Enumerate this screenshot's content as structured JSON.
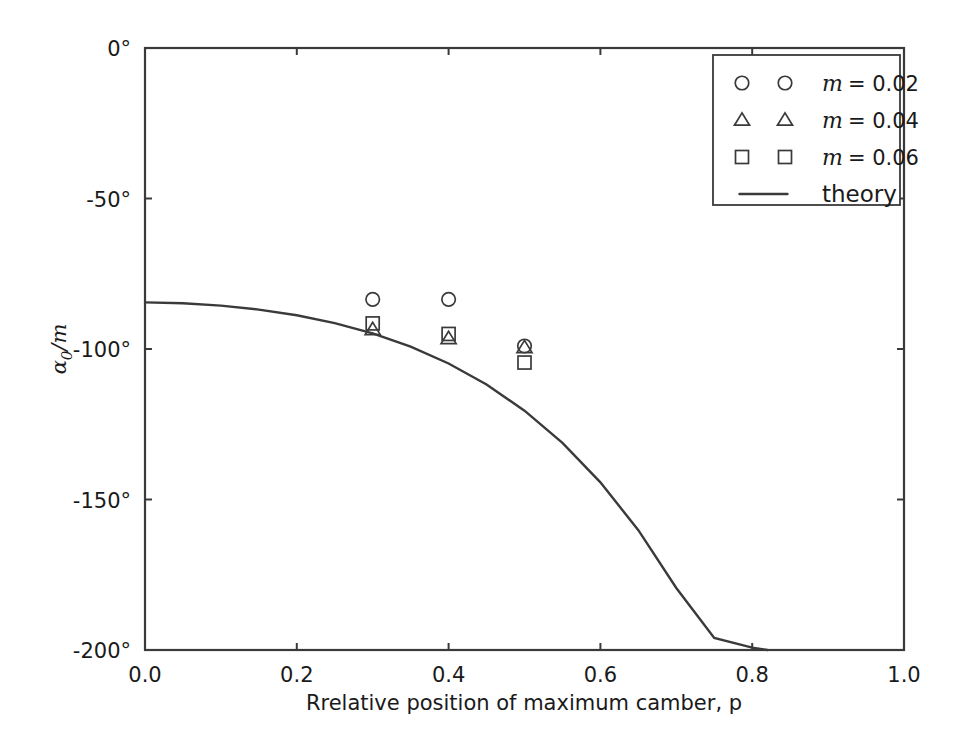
{
  "chart_data": {
    "type": "scatter",
    "title": "",
    "xlabel": "Rrelative position of maximum camber, p",
    "ylabel_parts": {
      "alpha": "α",
      "sub": "0",
      "slash": "/",
      "m": "m"
    },
    "ylabel": "α0/m",
    "xlim": [
      0.0,
      1.0
    ],
    "ylim": [
      -200,
      0
    ],
    "xticks": [
      0.0,
      0.2,
      0.4,
      0.6,
      0.8,
      1.0
    ],
    "xticklabels": [
      "0.0",
      "0.2",
      "0.4",
      "0.6",
      "0.8",
      "1.0"
    ],
    "yticks": [
      0,
      -50,
      -100,
      -150,
      -200
    ],
    "yticklabels": [
      "0°",
      "-50°",
      "-100°",
      "-150°",
      "-200°"
    ],
    "grid": false,
    "legend_position": "upper right",
    "series": [
      {
        "name": "m = 0.02",
        "marker": "circle",
        "x": [
          0.3,
          0.4,
          0.5
        ],
        "y": [
          -83.5,
          -83.5,
          -99.0
        ]
      },
      {
        "name": "m = 0.04",
        "marker": "triangle",
        "x": [
          0.3,
          0.4,
          0.5
        ],
        "y": [
          -93.5,
          -96.5,
          -99.5
        ]
      },
      {
        "name": "m = 0.06",
        "marker": "square",
        "x": [
          0.3,
          0.4,
          0.5
        ],
        "y": [
          -91.5,
          -95.0,
          -104.5
        ]
      },
      {
        "name": "theory",
        "marker": "line",
        "x": [
          0.0,
          0.05,
          0.1,
          0.15,
          0.2,
          0.25,
          0.3,
          0.35,
          0.4,
          0.45,
          0.5,
          0.55,
          0.6,
          0.65,
          0.7,
          0.75,
          0.8,
          0.82
        ],
        "y": [
          -84.5,
          -84.8,
          -85.6,
          -86.9,
          -88.8,
          -91.4,
          -94.8,
          -99.2,
          -104.8,
          -111.8,
          -120.5,
          -131.2,
          -144.3,
          -160.2,
          -179.4,
          -196.0,
          -199.2,
          -200.0
        ]
      }
    ],
    "legend_entries": [
      {
        "marker": "circle",
        "label": "m = 0.02",
        "label_lhs": "m",
        "label_rhs": "= 0.02"
      },
      {
        "marker": "triangle",
        "label": "m = 0.04",
        "label_lhs": "m",
        "label_rhs": "= 0.04"
      },
      {
        "marker": "square",
        "label": "m = 0.06",
        "label_lhs": "m",
        "label_rhs": "= 0.06"
      },
      {
        "marker": "line",
        "label": "theory",
        "label_lhs": "",
        "label_rhs": "theory"
      }
    ],
    "colors": {
      "axis": "#3a3a3a",
      "curve": "#3a3a3a",
      "marker": "#3a3a3a",
      "background": "#ffffff",
      "text": "#1a1a1a"
    }
  }
}
